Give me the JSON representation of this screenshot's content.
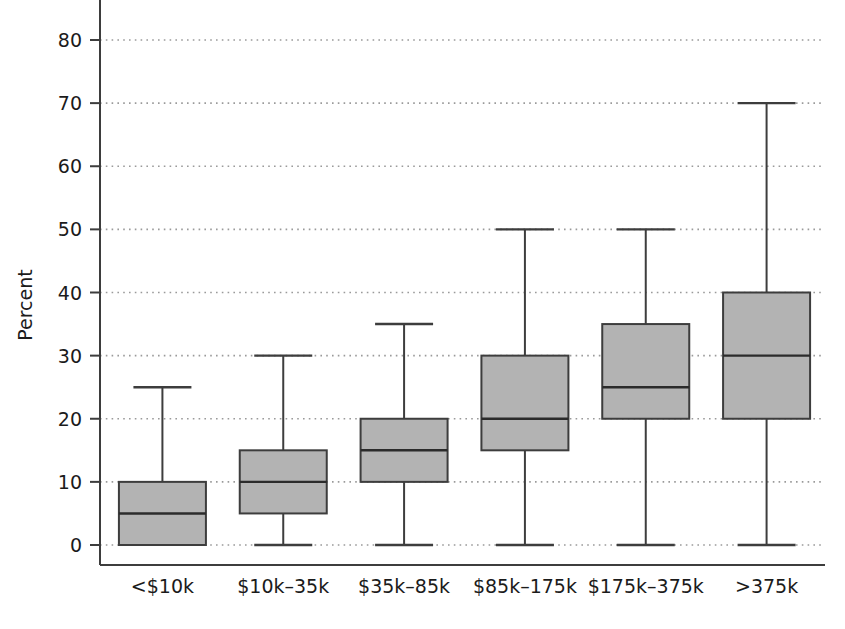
{
  "chart_data": {
    "type": "box",
    "title": "",
    "xlabel": "",
    "ylabel": "Percent",
    "ylim": [
      0,
      84
    ],
    "yticks": [
      0,
      10,
      20,
      30,
      40,
      50,
      60,
      70,
      80
    ],
    "ytick_labels": [
      "0",
      "10",
      "20",
      "30",
      "40",
      "50",
      "60",
      "70",
      "80"
    ],
    "grid": "horizontal-dotted",
    "legend": "none",
    "categories": [
      "<$10k",
      "$10k–35k",
      "$35k–85k",
      "$85k–175k",
      "$175k–375k",
      ">375k"
    ],
    "boxes": [
      {
        "category": "<$10k",
        "whisker_low": 0,
        "q1": 0,
        "median": 5,
        "q3": 10,
        "whisker_high": 25
      },
      {
        "category": "$10k–35k",
        "whisker_low": 0,
        "q1": 5,
        "median": 10,
        "q3": 15,
        "whisker_high": 30
      },
      {
        "category": "$35k–85k",
        "whisker_low": 0,
        "q1": 10,
        "median": 15,
        "q3": 20,
        "whisker_high": 35
      },
      {
        "category": "$85k–175k",
        "whisker_low": 0,
        "q1": 15,
        "median": 20,
        "q3": 30,
        "whisker_high": 50
      },
      {
        "category": "$175k–375k",
        "whisker_low": 0,
        "q1": 20,
        "median": 25,
        "q3": 35,
        "whisker_high": 50
      },
      {
        "category": ">375k",
        "whisker_low": 0,
        "q1": 20,
        "median": 30,
        "q3": 40,
        "whisker_high": 70
      }
    ],
    "colors": {
      "box_fill": "#b3b3b3",
      "box_edge": "#3d3d3d",
      "median_line": "#2b2b2b",
      "whisker": "#3d3d3d",
      "grid": "#9a9a9a",
      "axis": "#3d3d3d",
      "text": "#1b1b1b",
      "background": "#ffffff"
    }
  },
  "axes": {
    "y_title": "Percent"
  }
}
